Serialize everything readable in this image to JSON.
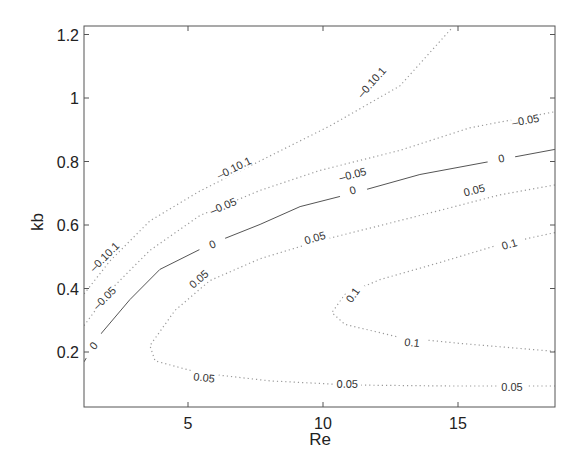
{
  "chart_data": {
    "type": "contour",
    "title": "",
    "xlabel": "Re",
    "ylabel": "kb",
    "xlim": [
      1.15,
      18.6
    ],
    "ylim": [
      0.027,
      1.23
    ],
    "xticks": [
      5,
      10,
      15
    ],
    "xtick_labels": [
      "5",
      "10",
      "15"
    ],
    "yticks": [
      0.2,
      0.4,
      0.6,
      0.8,
      1.0,
      1.2
    ],
    "ytick_labels": [
      "0.2",
      "0.4",
      "0.6",
      "0.8",
      "1",
      "1.2"
    ],
    "grid": false,
    "legend": null,
    "contours": [
      {
        "level": -0.1,
        "style": "dotted",
        "points": [
          [
            1.15,
            0.383
          ],
          [
            2.11,
            0.487
          ],
          [
            3.59,
            0.613
          ],
          [
            5.44,
            0.707
          ],
          [
            7.67,
            0.802
          ],
          [
            10.26,
            0.912
          ],
          [
            12.85,
            1.038
          ],
          [
            14.81,
            1.224
          ]
        ],
        "labels": [
          {
            "text": "-0.10.1",
            "x": 1.9,
            "y": 0.5
          },
          {
            "text": "-0.10.1",
            "x": 6.7,
            "y": 0.78
          },
          {
            "text": "-0.10.1",
            "x": 11.8,
            "y": 1.05
          }
        ]
      },
      {
        "level": -0.05,
        "style": "dotted",
        "points": [
          [
            1.15,
            0.283
          ],
          [
            2.11,
            0.394
          ],
          [
            3.59,
            0.52
          ],
          [
            5.44,
            0.63
          ],
          [
            7.67,
            0.709
          ],
          [
            9.89,
            0.772
          ],
          [
            12.85,
            0.835
          ],
          [
            15.44,
            0.906
          ],
          [
            18.59,
            0.957
          ]
        ],
        "labels": [
          {
            "text": "-0.05",
            "x": 1.9,
            "y": 0.37
          },
          {
            "text": "-0.05",
            "x": 6.3,
            "y": 0.66
          },
          {
            "text": "-0.05",
            "x": 11.1,
            "y": 0.76
          },
          {
            "text": "-0.05",
            "x": 17.5,
            "y": 0.93
          }
        ]
      },
      {
        "level": 0,
        "style": "solid",
        "points": [
          [
            1.15,
            0.169
          ],
          [
            1.74,
            0.254
          ],
          [
            2.85,
            0.365
          ],
          [
            3.96,
            0.46
          ],
          [
            5.81,
            0.539
          ],
          [
            7.67,
            0.602
          ],
          [
            9.15,
            0.658
          ],
          [
            11.19,
            0.702
          ],
          [
            13.59,
            0.759
          ],
          [
            16.56,
            0.806
          ],
          [
            18.59,
            0.838
          ]
        ],
        "labels": [
          {
            "text": "0",
            "x": 1.5,
            "y": 0.22
          },
          {
            "text": "0",
            "x": 5.9,
            "y": 0.54
          },
          {
            "text": "0",
            "x": 11.1,
            "y": 0.71
          },
          {
            "text": "0",
            "x": 16.6,
            "y": 0.81
          }
        ]
      },
      {
        "level": 0.05,
        "style": "dotted",
        "points": [
          [
            18.59,
            0.726
          ],
          [
            16.56,
            0.695
          ],
          [
            14.33,
            0.646
          ],
          [
            12.11,
            0.598
          ],
          [
            9.89,
            0.551
          ],
          [
            7.67,
            0.494
          ],
          [
            5.81,
            0.425
          ],
          [
            4.52,
            0.331
          ],
          [
            3.59,
            0.22
          ],
          [
            3.78,
            0.172
          ],
          [
            5.44,
            0.134
          ],
          [
            8.04,
            0.109
          ],
          [
            11.0,
            0.096
          ],
          [
            14.7,
            0.093
          ],
          [
            18.59,
            0.093
          ]
        ],
        "labels": [
          {
            "text": "0.05",
            "x": 15.6,
            "y": 0.71
          },
          {
            "text": "0.05",
            "x": 9.7,
            "y": 0.56
          },
          {
            "text": "0.05",
            "x": 5.4,
            "y": 0.43
          },
          {
            "text": "0.05",
            "x": 5.6,
            "y": 0.12
          },
          {
            "text": "0.05",
            "x": 10.9,
            "y": 0.1
          },
          {
            "text": "0.05",
            "x": 17.0,
            "y": 0.09
          }
        ]
      },
      {
        "level": 0.1,
        "style": "dotted",
        "points": [
          [
            18.59,
            0.576
          ],
          [
            16.56,
            0.539
          ],
          [
            14.33,
            0.482
          ],
          [
            12.11,
            0.428
          ],
          [
            10.81,
            0.381
          ],
          [
            10.33,
            0.324
          ],
          [
            10.81,
            0.287
          ],
          [
            12.85,
            0.246
          ],
          [
            15.07,
            0.227
          ],
          [
            18.59,
            0.202
          ]
        ],
        "labels": [
          {
            "text": "0.1",
            "x": 16.9,
            "y": 0.54
          },
          {
            "text": "0.1",
            "x": 11.1,
            "y": 0.38
          },
          {
            "text": "0.1",
            "x": 13.3,
            "y": 0.23
          }
        ]
      }
    ]
  },
  "colors": {
    "axis": "#555555",
    "contour": "#555555",
    "dotted_contour": "#9a9a9a",
    "text": "#222222"
  }
}
